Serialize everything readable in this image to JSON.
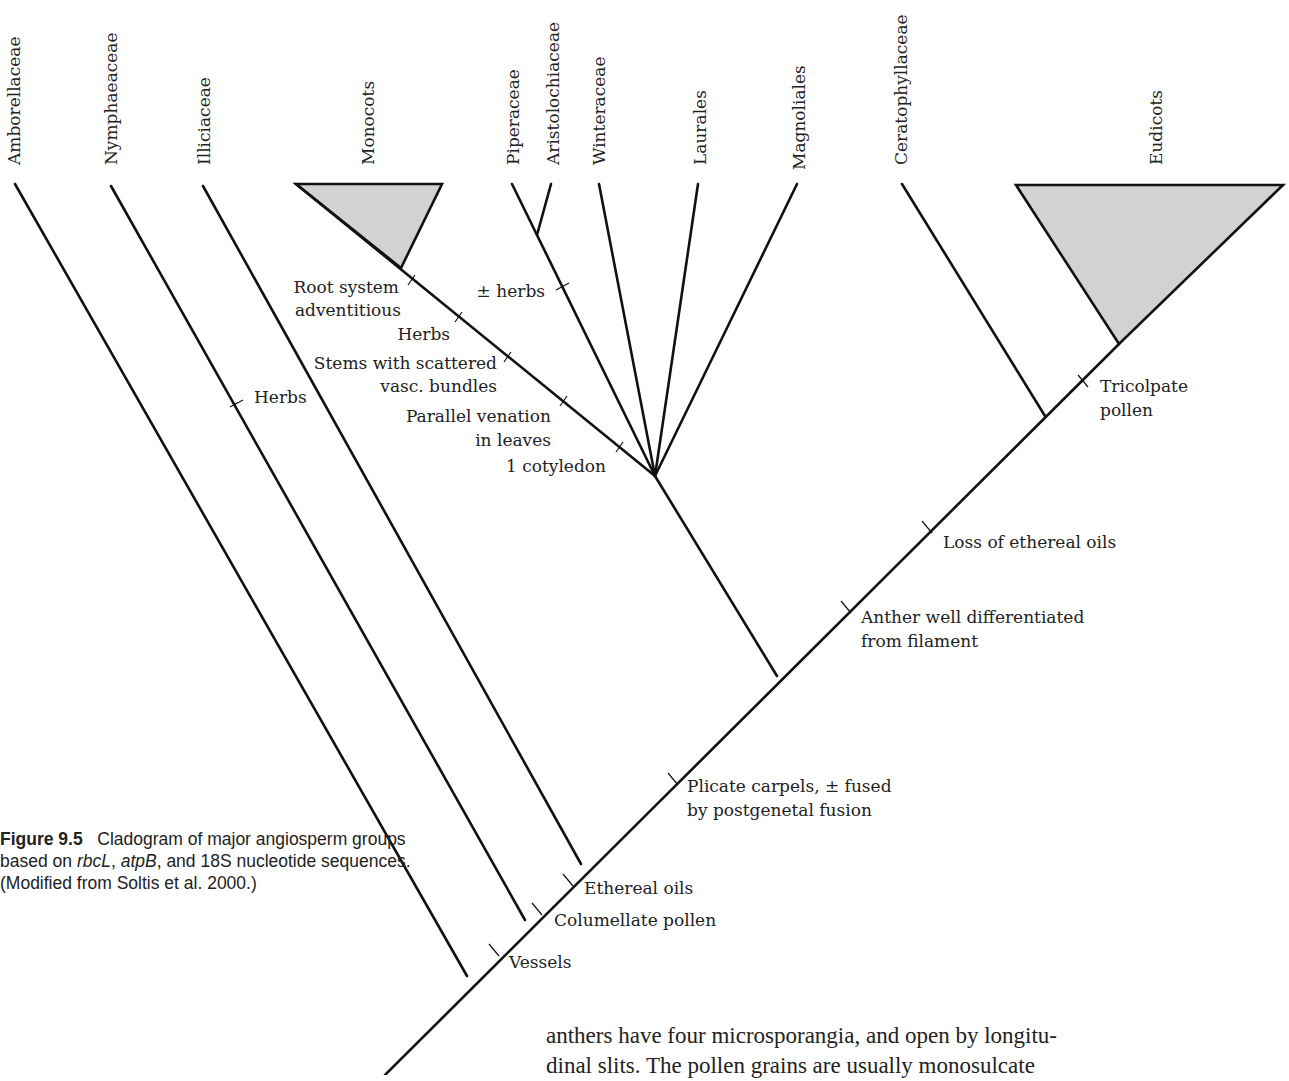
{
  "figure": {
    "type": "cladogram",
    "taxa": [
      {
        "id": "amborellaceae",
        "label": "Amborellaceae"
      },
      {
        "id": "nymphaeaceae",
        "label": "Nymphaeaceae"
      },
      {
        "id": "illiciaceae",
        "label": "Illiciaceae"
      },
      {
        "id": "monocots",
        "label": "Monocots"
      },
      {
        "id": "piperaceae",
        "label": "Piperaceae"
      },
      {
        "id": "aristolochiaceae",
        "label": "Aristolochiaceae"
      },
      {
        "id": "winteraceae",
        "label": "Winteraceae"
      },
      {
        "id": "laurales",
        "label": "Laurales"
      },
      {
        "id": "magnoliales",
        "label": "Magnoliales"
      },
      {
        "id": "ceratophyllaceae",
        "label": "Ceratophyllaceae"
      },
      {
        "id": "eudicots",
        "label": "Eudicots"
      }
    ],
    "traits": {
      "root_system": [
        "Root system",
        "adventitious"
      ],
      "monocot_herbs": "Herbs",
      "stems": [
        "Stems with scattered",
        "vasc. bundles"
      ],
      "parallel": [
        "Parallel venation",
        "in leaves"
      ],
      "cotyledon": "1 cotyledon",
      "pm_herbs": "± herbs",
      "nymph_herbs": "Herbs",
      "tricolpate": [
        "Tricolpate",
        "pollen"
      ],
      "loss_oils": "Loss of ethereal oils",
      "anther": [
        "Anther well differentiated",
        "from filament"
      ],
      "plicate": [
        "Plicate carpels,  ± fused",
        "by postgenetal fusion"
      ],
      "ethereal": "Ethereal oils",
      "columellate": "Columellate pollen",
      "vessels": "Vessels"
    },
    "colors": {
      "line": "#111111",
      "clade_fill": "#d2d2d2",
      "text": "#222222"
    }
  },
  "caption": {
    "label": "Figure 9.5",
    "text_1": "Cladogram of major angiosperm groups based on ",
    "gene_1": "rbcL",
    "sep_1": ", ",
    "gene_2": "atpB",
    "text_2": ", and 18S nucleotide sequences. (Modified from Soltis et al. 2000.)"
  },
  "body_text": {
    "line_1": "anthers have four microsporangia, and open by longitu-",
    "line_2": "dinal slits. The pollen grains are usually monosulcate"
  }
}
